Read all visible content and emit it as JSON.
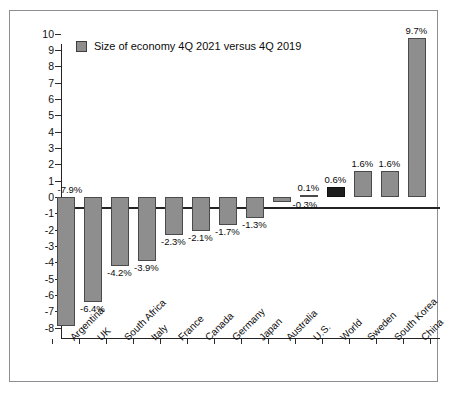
{
  "legend": {
    "swatch_color": "#8e8e8e",
    "label": "Size of economy 4Q 2021 versus 4Q 2019"
  },
  "colors": {
    "bar": "#8e8e8e",
    "bar_highlight": "#1c1c1c",
    "axis": "#232323",
    "frame": "#8d8d93",
    "text": "#0b0b0b",
    "background": "#ffffff"
  },
  "chart_data": {
    "type": "bar",
    "title": "",
    "subtitle": "",
    "xlabel": "",
    "ylabel": "",
    "ylim": [
      -8,
      10
    ],
    "ytick_step": 1,
    "grid": false,
    "legend_position": "top-left",
    "legend_entries": [
      "Size of economy 4Q 2021 versus 4Q 2019"
    ],
    "highlight_category": "World",
    "categories": [
      "Argentina",
      "UK",
      "South Africa",
      "Italy",
      "France",
      "Canada",
      "Germany",
      "Japan",
      "Australia",
      "U.S.",
      "World",
      "Sweden",
      "South Korea",
      "China"
    ],
    "values": [
      -7.9,
      -6.4,
      -4.2,
      -3.9,
      -2.3,
      -2.1,
      -1.7,
      -1.3,
      -0.3,
      0.1,
      0.6,
      1.6,
      1.6,
      9.7
    ],
    "data_labels": [
      "-7.9%",
      "-6.4%",
      "-4.2%",
      "-3.9%",
      "-2.3%",
      "-2.1%",
      "-1.7%",
      "-1.3%",
      "-0.3%",
      "0.1%",
      "0.6%",
      "1.6%",
      "1.6%",
      "9.7%"
    ],
    "ytick_labels": [
      "10",
      "9",
      "8",
      "7",
      "6",
      "5",
      "4",
      "3",
      "2",
      "1",
      "0",
      "-1",
      "-2",
      "-3",
      "-4",
      "-5",
      "-6",
      "-7",
      "-8"
    ],
    "ytick_values": [
      10,
      9,
      8,
      7,
      6,
      5,
      4,
      3,
      2,
      1,
      0,
      -1,
      -2,
      -3,
      -4,
      -5,
      -6,
      -7,
      -8
    ]
  }
}
